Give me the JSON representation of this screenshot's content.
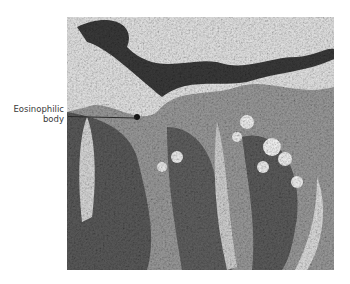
{
  "figure": {
    "type": "histology-micrograph",
    "annotations": [
      {
        "label_line1": "Eosinophilic",
        "label_line2": "body",
        "pointer": "leader-line"
      }
    ],
    "colors": {
      "background": "#ffffff",
      "label_text": "#3a3a3a",
      "leader_line": "#2a2a2a"
    }
  }
}
